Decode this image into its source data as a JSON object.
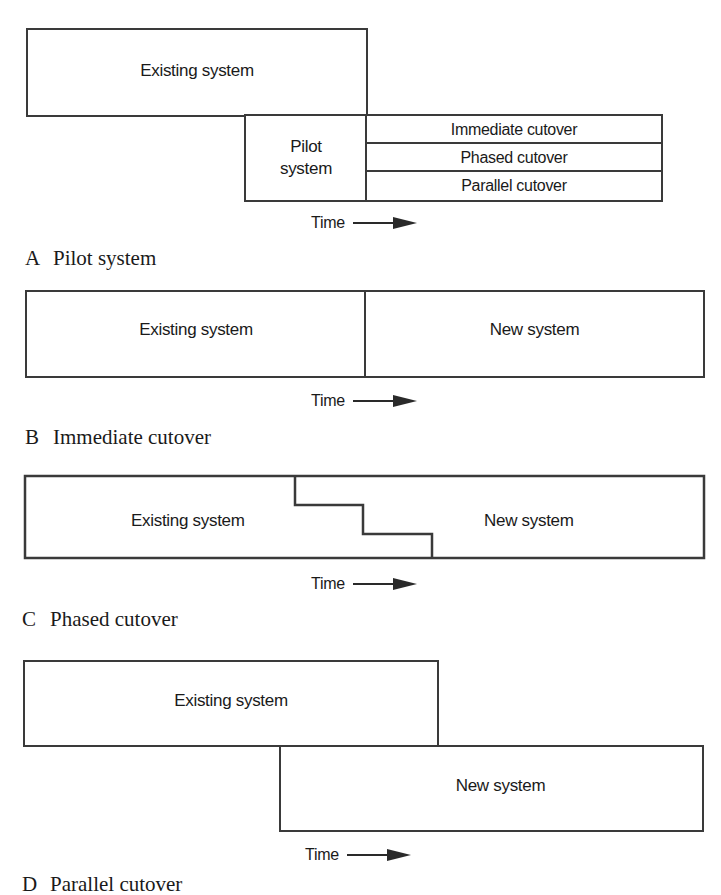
{
  "diagrams": {
    "a": {
      "caption_letter": "A",
      "caption_title": "Pilot system",
      "existing_label": "Existing system",
      "pilot_label_line1": "Pilot",
      "pilot_label_line2": "system",
      "options": [
        "Immediate cutover",
        "Phased cutover",
        "Parallel cutover"
      ],
      "time_label": "Time"
    },
    "b": {
      "caption_letter": "B",
      "caption_title": "Immediate cutover",
      "existing_label": "Existing system",
      "new_label": "New system",
      "time_label": "Time"
    },
    "c": {
      "caption_letter": "C",
      "caption_title": "Phased cutover",
      "existing_label": "Existing system",
      "new_label": "New system",
      "time_label": "Time"
    },
    "d": {
      "caption_letter": "D",
      "caption_title": "Parallel cutover",
      "existing_label": "Existing system",
      "new_label": "New system",
      "time_label": "Time"
    }
  },
  "colors": {
    "line": "#3a3a3a",
    "text": "#1a1a1a",
    "background": "#ffffff"
  }
}
